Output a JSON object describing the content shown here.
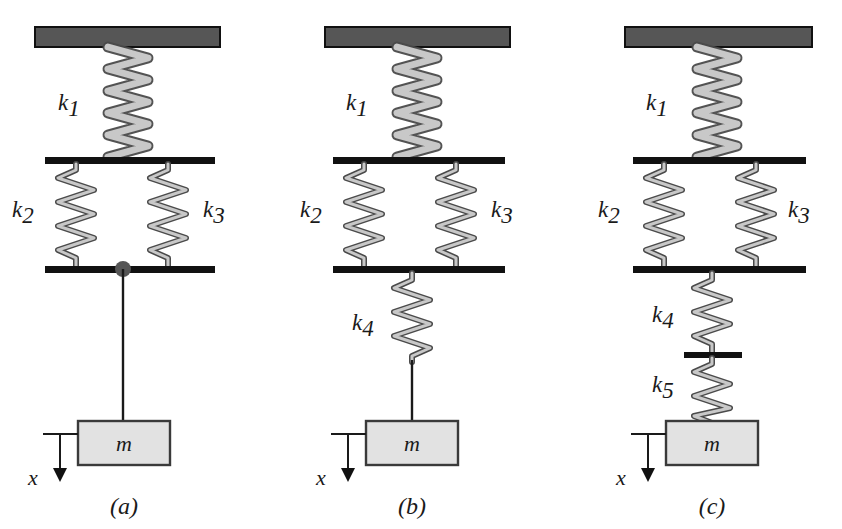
{
  "figure": {
    "background_color": "#ffffff",
    "ceiling_color": "#565656",
    "bar_color": "#111111",
    "spring_fill": "#c8c8c8",
    "spring_stroke": "#4a4a4a",
    "mass_fill": "#e2e2e2",
    "mass_stroke": "#3a3a3a",
    "joint_color": "#555555",
    "line_color": "#1a1a1a"
  },
  "panels": [
    {
      "id": "a",
      "label": "(a)",
      "mass_label": "m",
      "axis_label": "x",
      "springs": [
        {
          "name": "k1",
          "base": "k",
          "sub": "1",
          "orientation": "vertical",
          "style": "coil",
          "position": "top-center"
        },
        {
          "name": "k2",
          "base": "k",
          "sub": "2",
          "orientation": "vertical",
          "style": "zigzag",
          "position": "middle-left"
        },
        {
          "name": "k3",
          "base": "k",
          "sub": "3",
          "orientation": "vertical",
          "style": "zigzag",
          "position": "middle-right"
        }
      ],
      "has_joint_dot": true,
      "has_lower_rod": true,
      "has_k4": false,
      "has_k5": false,
      "has_mid_divider": false
    },
    {
      "id": "b",
      "label": "(b)",
      "mass_label": "m",
      "axis_label": "x",
      "springs": [
        {
          "name": "k1",
          "base": "k",
          "sub": "1",
          "orientation": "vertical",
          "style": "coil",
          "position": "top-center"
        },
        {
          "name": "k2",
          "base": "k",
          "sub": "2",
          "orientation": "vertical",
          "style": "zigzag",
          "position": "middle-left"
        },
        {
          "name": "k3",
          "base": "k",
          "sub": "3",
          "orientation": "vertical",
          "style": "zigzag",
          "position": "middle-right"
        },
        {
          "name": "k4",
          "base": "k",
          "sub": "4",
          "orientation": "vertical",
          "style": "zigzag",
          "position": "lower-center"
        }
      ],
      "has_joint_dot": false,
      "has_lower_rod": true,
      "has_k4": true,
      "has_k5": false,
      "has_mid_divider": false
    },
    {
      "id": "c",
      "label": "(c)",
      "mass_label": "m",
      "axis_label": "x",
      "springs": [
        {
          "name": "k1",
          "base": "k",
          "sub": "1",
          "orientation": "vertical",
          "style": "coil",
          "position": "top-center"
        },
        {
          "name": "k2",
          "base": "k",
          "sub": "2",
          "orientation": "vertical",
          "style": "zigzag",
          "position": "middle-left"
        },
        {
          "name": "k3",
          "base": "k",
          "sub": "3",
          "orientation": "vertical",
          "style": "zigzag",
          "position": "middle-right"
        },
        {
          "name": "k4",
          "base": "k",
          "sub": "4",
          "orientation": "vertical",
          "style": "zigzag",
          "position": "lower-center-upper"
        },
        {
          "name": "k5",
          "base": "k",
          "sub": "5",
          "orientation": "vertical",
          "style": "zigzag",
          "position": "lower-center-lower"
        }
      ],
      "has_joint_dot": false,
      "has_lower_rod": false,
      "has_k4": true,
      "has_k5": true,
      "has_mid_divider": true
    }
  ]
}
